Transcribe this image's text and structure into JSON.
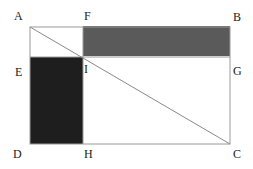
{
  "diagram": {
    "labels": {
      "A": "A",
      "F": "F",
      "B": "B",
      "E": "E",
      "I": "I",
      "G": "G",
      "D": "D",
      "H": "H",
      "C": "C"
    },
    "colors": {
      "gray_rect": "#5a5a5a",
      "dark_rect": "#1e1e1e",
      "lines": "#9a9a9a"
    }
  }
}
